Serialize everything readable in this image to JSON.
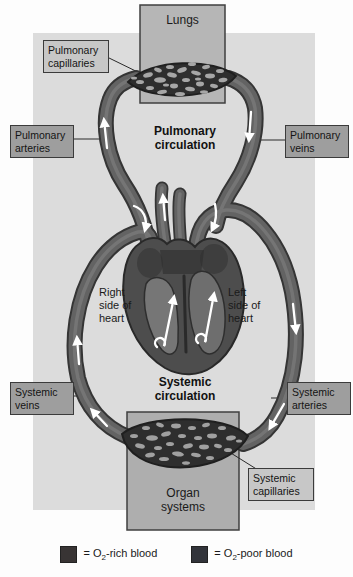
{
  "figure": {
    "lungs_label": "Lungs",
    "organ_systems_label": "Organ systems",
    "pulmonary_circulation": "Pulmonary circulation",
    "systemic_circulation": "Systemic circulation",
    "right_side_of_heart": "Right side of heart",
    "left_side_of_heart": "Left side of heart"
  },
  "callouts": {
    "pulmonary_capillaries": "Pulmonary capillaries",
    "pulmonary_arteries": "Pulmonary arteries",
    "pulmonary_veins": "Pulmonary veins",
    "systemic_veins": "Systemic veins",
    "systemic_arteries": "Systemic arteries",
    "systemic_capillaries": "Systemic capillaries"
  },
  "legend": {
    "o2_rich": {
      "prefix": "= O",
      "subscript": "2",
      "label": "-rich blood",
      "swatch_color": "#383434"
    },
    "o2_poor": {
      "prefix": "= O",
      "subscript": "2",
      "label": "-poor blood",
      "swatch_color": "#32343a"
    }
  },
  "colors": {
    "panel_background": "#dcdcdc",
    "vessel_body": "#636363",
    "vessel_outline": "#353535",
    "capillary_mesh": "#2e2e2e",
    "callout_box_fill": "#9e9e9e",
    "capillary_box_fill": "#c7c7c7",
    "lungs_box_fill": "#b6b6b6",
    "organ_box_fill": "#aeaeae"
  }
}
